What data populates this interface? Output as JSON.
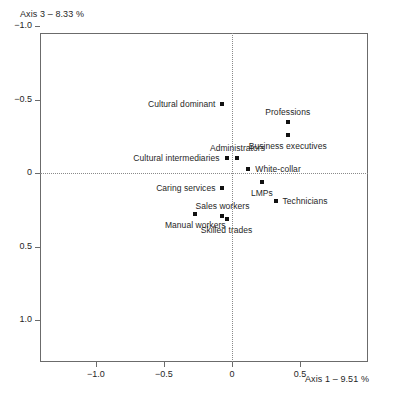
{
  "chart_data": {
    "type": "scatter",
    "title": "",
    "xlabel": "Axis 1 – 9.51 %",
    "ylabel": "Axis 3 – 8.33 %",
    "xlim": [
      -1.41,
      1.0
    ],
    "ylim": [
      -0.95,
      1.29
    ],
    "y_axis_inverted": true,
    "grid": false,
    "reference_lines": {
      "x": 0,
      "y": 0,
      "style": "dotted"
    },
    "xticks": [
      -1.0,
      -0.5,
      0,
      0.5
    ],
    "xticklabels": [
      "−1.0",
      "−0.5",
      "0",
      "0.5"
    ],
    "yticks": [
      -1.0,
      -0.5,
      0,
      0.5,
      1.0
    ],
    "yticklabels": [
      "−1.0",
      "−0.5",
      "0",
      "0.5",
      "1.0"
    ],
    "legend": null,
    "points": [
      {
        "label": "Cultural dominant",
        "x": -0.07,
        "y": -0.47,
        "label_pos": "left"
      },
      {
        "label": "Professions",
        "x": 0.41,
        "y": -0.35,
        "label_pos": "above"
      },
      {
        "label": "Business executives",
        "x": 0.41,
        "y": -0.26,
        "label_pos": "below"
      },
      {
        "label": "Cultural intermediaries",
        "x": -0.04,
        "y": -0.1,
        "label_pos": "left"
      },
      {
        "label": "Administrators",
        "x": 0.04,
        "y": -0.1,
        "label_pos": "above"
      },
      {
        "label": "White-collar",
        "x": 0.12,
        "y": -0.03,
        "label_pos": "right"
      },
      {
        "label": "LMPs",
        "x": 0.22,
        "y": 0.06,
        "label_pos": "below"
      },
      {
        "label": "Technicians",
        "x": 0.32,
        "y": 0.19,
        "label_pos": "right"
      },
      {
        "label": "Caring services",
        "x": -0.07,
        "y": 0.1,
        "label_pos": "left"
      },
      {
        "label": "Sales workers",
        "x": -0.07,
        "y": 0.29,
        "label_pos": "above"
      },
      {
        "label": "Skilled trades",
        "x": -0.04,
        "y": 0.31,
        "label_pos": "below"
      },
      {
        "label": "Manual workers",
        "x": -0.27,
        "y": 0.28,
        "label_pos": "below"
      }
    ]
  }
}
